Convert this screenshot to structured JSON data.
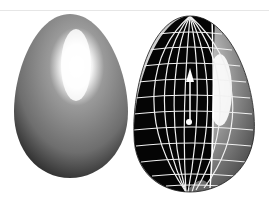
{
  "scene": {
    "description": "Two rendered 3D eggs: a smooth shaded egg and a cut-away egg showing wireframe interior",
    "colors": {
      "background": "#ffffff",
      "shell_dark": "#2a2a2a",
      "shell_mid": "#7a7a7a",
      "highlight": "#ffffff",
      "interior": "#050505",
      "grid": "#f0f0f0"
    },
    "objects": [
      {
        "name": "shaded-egg",
        "label": "Smooth shaded egg"
      },
      {
        "name": "cutaway-egg",
        "label": "Cut-away egg with wireframe interior"
      }
    ]
  }
}
